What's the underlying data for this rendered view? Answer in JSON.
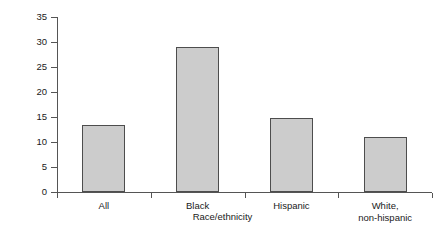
{
  "chart_data": {
    "type": "bar",
    "title": "",
    "subtitle": "",
    "xlabel": "Race/ethnicity",
    "ylabel": "Annualized rate per 100,000 per year",
    "categories": [
      "All",
      "Black",
      "Hispanic",
      "White,\nnon-hispanic"
    ],
    "values": [
      13.5,
      29.0,
      14.8,
      11.0
    ],
    "ylim": [
      0,
      35
    ],
    "yticks": [
      0,
      5,
      10,
      15,
      20,
      25,
      30,
      35
    ],
    "ytick_labels": [
      "0",
      "5",
      "10",
      "15",
      "20",
      "25",
      "30",
      "35"
    ],
    "grid": false,
    "legend": false,
    "legend_position": "none",
    "bar_fill_color": "#cccccc",
    "bar_edge_color": "#4d4d4d",
    "axis_color": "#555555",
    "background_color": "#ffffff"
  }
}
